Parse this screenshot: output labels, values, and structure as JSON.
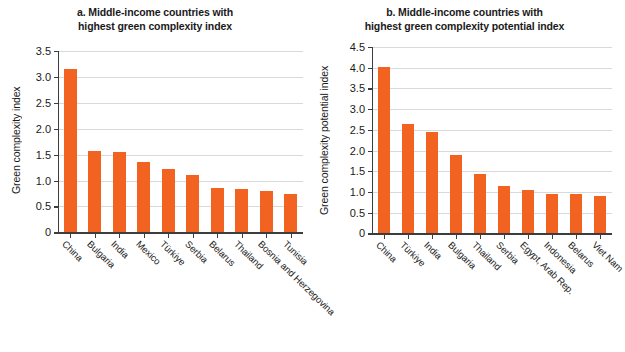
{
  "figure": {
    "background": "#ffffff",
    "bar_color": "#f26322",
    "grid_color": "#d9d9d9",
    "axis_color": "#3d3d3d"
  },
  "chart_data": [
    {
      "type": "bar",
      "panel": "a",
      "title": "a. Middle-income countries with highest green complexity index",
      "title_line1": "a. Middle-income countries with",
      "title_line2": "highest green complexity index",
      "xlabel": "",
      "ylabel": "Green complexity index",
      "ylim": [
        0,
        3.5
      ],
      "yticks": [
        0,
        0.5,
        1.0,
        1.5,
        2.0,
        2.5,
        3.0,
        3.5
      ],
      "ytick_labels": [
        "0",
        "0.5",
        "1.0",
        "1.5",
        "2.0",
        "2.5",
        "3.0",
        "3.5"
      ],
      "grid": true,
      "legend": false,
      "categories": [
        "China",
        "Bulgaria",
        "India",
        "Mexico",
        "Türkiye",
        "Serbia",
        "Belarus",
        "Thailand",
        "Bosnia and Herzegovina",
        "Tunisia"
      ],
      "values": [
        3.15,
        1.57,
        1.56,
        1.36,
        1.22,
        1.11,
        0.86,
        0.83,
        0.79,
        0.75
      ]
    },
    {
      "type": "bar",
      "panel": "b",
      "title": "b. Middle-income countries with highest green complexity potential index",
      "title_line1": "b. Middle-income countries with",
      "title_line2": "highest green complexity potential index",
      "xlabel": "",
      "ylabel": "Green complexity potential index",
      "ylim": [
        0,
        4.5
      ],
      "yticks": [
        0,
        0.5,
        1.0,
        1.5,
        2.0,
        2.5,
        3.0,
        3.5,
        4.0,
        4.5
      ],
      "ytick_labels": [
        "0",
        "0.5",
        "1.0",
        "1.5",
        "2.0",
        "2.5",
        "3.0",
        "3.5",
        "4.0",
        "4.5"
      ],
      "grid": true,
      "legend": false,
      "categories": [
        "China",
        "Türkiye",
        "India",
        "Bulgaria",
        "Thailand",
        "Serbia",
        "Egypt, Arab Rep.",
        "Indonesia",
        "Belarus",
        "Viet Nam"
      ],
      "values": [
        4.01,
        2.63,
        2.44,
        1.9,
        1.44,
        1.15,
        1.04,
        0.95,
        0.95,
        0.91
      ]
    }
  ]
}
